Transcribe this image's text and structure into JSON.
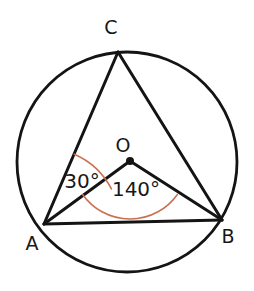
{
  "figure": {
    "kind": "circle-geometry-diagram",
    "canvas": {
      "width": 254,
      "height": 291,
      "background": "#ffffff"
    },
    "colors": {
      "stroke": "#141414",
      "arc_accent": "#C87050",
      "text": "#171717",
      "background": "#ffffff"
    }
  },
  "circle": {
    "name": "main-circle",
    "cx": 127,
    "cy": 162,
    "r": 110,
    "stroke_width": 2.8
  },
  "points": {
    "A": {
      "label": "A",
      "x": 44,
      "y": 224,
      "label_x": 32,
      "label_y": 250
    },
    "B": {
      "label": "B",
      "x": 222,
      "y": 220,
      "label_x": 228,
      "label_y": 243
    },
    "C": {
      "label": "C",
      "x": 118,
      "y": 52,
      "label_x": 111,
      "label_y": 34
    },
    "O": {
      "label": "O",
      "x": 130,
      "y": 161,
      "label_x": 123,
      "label_y": 152,
      "dot_r": 4
    }
  },
  "segments": [
    {
      "name": "chord-CA",
      "from": "C",
      "to": "A",
      "stroke_width": 3
    },
    {
      "name": "chord-CB",
      "from": "C",
      "to": "B",
      "stroke_width": 3
    },
    {
      "name": "chord-AB",
      "from": "A",
      "to": "B",
      "stroke_width": 3
    },
    {
      "name": "radius-OA",
      "from": "O",
      "to": "A",
      "stroke_width": 3
    },
    {
      "name": "radius-OB",
      "from": "O",
      "to": "B",
      "stroke_width": 3
    }
  ],
  "angles": [
    {
      "name": "angle-at-A",
      "value": "30°",
      "vertex": "A",
      "label_x": 82,
      "label_y": 188,
      "arc": {
        "cx": 44,
        "cy": 224,
        "r": 76,
        "start_deg": -66.5,
        "end_deg": -27.5,
        "stroke": "#C87050",
        "stroke_width": 1.6
      }
    },
    {
      "name": "angle-at-O",
      "value": "140°",
      "vertex": "O",
      "label_x": 136,
      "label_y": 196,
      "arc": {
        "cx": 130,
        "cy": 161,
        "r": 58,
        "start_deg": 35.5,
        "end_deg": 144.5,
        "stroke": "#C87050",
        "stroke_width": 1.6
      }
    }
  ]
}
